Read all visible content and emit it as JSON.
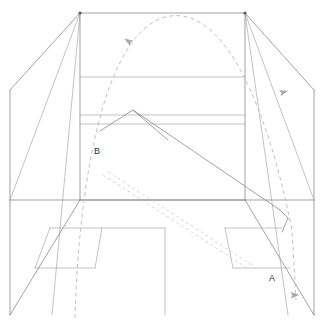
{
  "diagram": {
    "type": "line-drawing",
    "canvas": {
      "width": 325,
      "height": 321,
      "background": "#ffffff"
    },
    "colors": {
      "solid_stroke": "#7a7a80",
      "faint_stroke": "#9b9ba1",
      "dashed_trajectory": "#b9b9bf",
      "dashed_guide": "#c6c6cc",
      "arrow_fill": "#a8a8af",
      "label_text": "#2e2e33"
    },
    "labels": [
      {
        "id": "label-a",
        "text": "A",
        "x": 272,
        "y": 279
      },
      {
        "id": "label-b",
        "text": "B",
        "x": 97,
        "y": 152
      }
    ],
    "geometry": {
      "room_outline": "M 10,90 L 80,13 L 245,13 L 314,90 L 314,315 L 10,315 Z",
      "left_ceiling_edge": "M 80,13 L 10,90",
      "right_ceiling_edge": "M 245,13 L 314,90",
      "left_vertical": "M 10,90 L 10,315",
      "right_vertical": "M 314,90 L 314,315",
      "floor_line_left": "M 10,315 L 80,200",
      "floor_line_right": "M 314,315 L 245,200",
      "back_wall_left": "M 80,13 L 80,200",
      "back_wall_right": "M 245,13 L 245,200",
      "back_wall_top": "M 80,13 L 245,13",
      "band_upper": "M 80,77 L 245,77",
      "band_lower_a": "M 80,115 L 245,115",
      "band_lower_b": "M 80,124 L 245,124",
      "mid_horizon": "M 10,200 L 314,200",
      "back_wall_base": "M 80,200 L 245,200",
      "chevron": "M 100,131 L 133,110 L 168,140",
      "long_diagonal": "M 133,110 L 280,210",
      "right_fold_a": "M 280,210 L 288,218",
      "right_fold_b": "M 288,218 L 282,232",
      "left_corner_diag": "M 80,13 L 10,200",
      "left_corner_diag2": "M 80,13 L 52,315",
      "right_corner_diag": "M 245,13 L 314,200",
      "right_corner_diag2": "M 245,13 L 288,315",
      "panel_left_top": "M 50,228 L 165,228",
      "panel_left_inner_v": "M 102,228 L 95,268",
      "panel_left_inner_h": "M 35,268 L 95,268",
      "panel_left_diag": "M 50,228 L 35,268",
      "panel_center_v": "M 165,228 L 165,315",
      "panel_right_top": "M 225,228 L 282,228",
      "panel_right_diag": "M 225,228 L 233,268",
      "panel_right_h": "M 233,268 L 290,268",
      "trajectory_curve": "M 75,318 C 78,200 100,35 165,17 C 225,2 268,110 292,230 L 296,300",
      "guide_line_1": "M 103,175 L 247,268",
      "guide_line_2": "M 108,172 L 252,265"
    },
    "arrows": [
      {
        "id": "arrow-ascending",
        "x": 128,
        "y": 41,
        "angle": -58
      },
      {
        "id": "arrow-descending-upper",
        "x": 284,
        "y": 92,
        "angle": 74
      },
      {
        "id": "arrow-descending-lower",
        "x": 295,
        "y": 295,
        "angle": 86
      }
    ],
    "vertices": [
      {
        "id": "vertex-top-left",
        "x": 80,
        "y": 13
      },
      {
        "id": "vertex-top-right",
        "x": 245,
        "y": 13
      }
    ]
  }
}
